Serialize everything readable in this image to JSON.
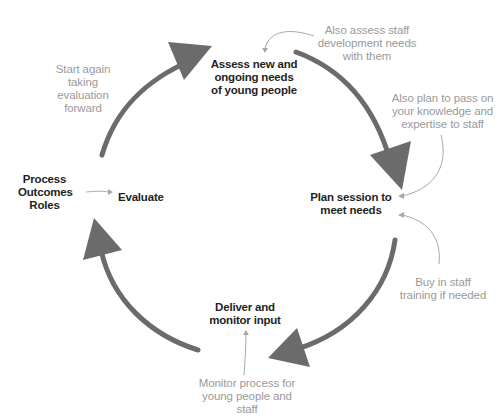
{
  "colors": {
    "cycle_arrow": "#6b6b6b",
    "stage_text": "#1f1f1f",
    "note_text": "#9a9a9a",
    "note_arrow": "#a8a8a8"
  },
  "stages": {
    "assess": "Assess new and\nongoing needs\nof young people",
    "plan": "Plan session to\nmeet needs",
    "deliver": "Deliver and\nmonitor input",
    "evaluate": "Evaluate"
  },
  "notes": {
    "assess_staff": "Also assess staff\ndevelopment needs\nwith them",
    "pass_knowledge": "Also plan to pass on\nyour knowledge and\nexpertise to staff",
    "buy_training": "Buy in staff\ntraining if needed",
    "monitor_process": "Monitor process for\nyoung people and staff",
    "start_again": "Start again\ntaking evaluation\nforward",
    "evaluation_criteria": "Process\nOutcomes\nRoles"
  }
}
